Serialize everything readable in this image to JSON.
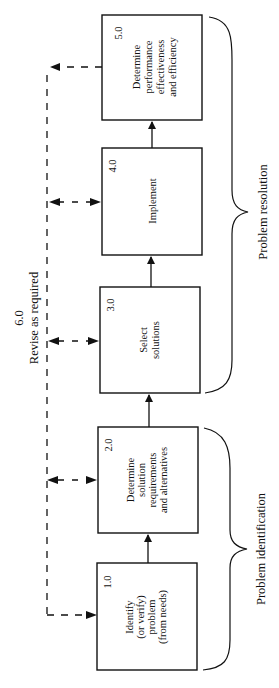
{
  "diagram": {
    "orientation": "rotated-90-ccw",
    "boxes": [
      {
        "id": "1.0",
        "number": "1.0",
        "lines": [
          "Identify",
          "(or verify)",
          "problem",
          "(from needs)"
        ]
      },
      {
        "id": "2.0",
        "number": "2.0",
        "lines": [
          "Determine",
          "solution",
          "requirements",
          "and alternatives"
        ]
      },
      {
        "id": "3.0",
        "number": "3.0",
        "lines": [
          "Select",
          "solutions"
        ]
      },
      {
        "id": "4.0",
        "number": "4.0",
        "lines": [
          "Implement"
        ]
      },
      {
        "id": "5.0",
        "number": "5.0",
        "lines": [
          "Determine",
          "performance",
          "effectiveness",
          "and efficiency"
        ]
      }
    ],
    "feedback": {
      "number": "6.0",
      "label": "Revise as required"
    },
    "groups": [
      {
        "label": "Problem identification",
        "spans": [
          "1.0",
          "2.0"
        ]
      },
      {
        "label": "Problem resolution",
        "spans": [
          "3.0",
          "4.0",
          "5.0"
        ]
      }
    ],
    "flow": [
      "1.0 → 2.0",
      "2.0 → 3.0",
      "3.0 → 4.0",
      "4.0 → 5.0"
    ]
  }
}
